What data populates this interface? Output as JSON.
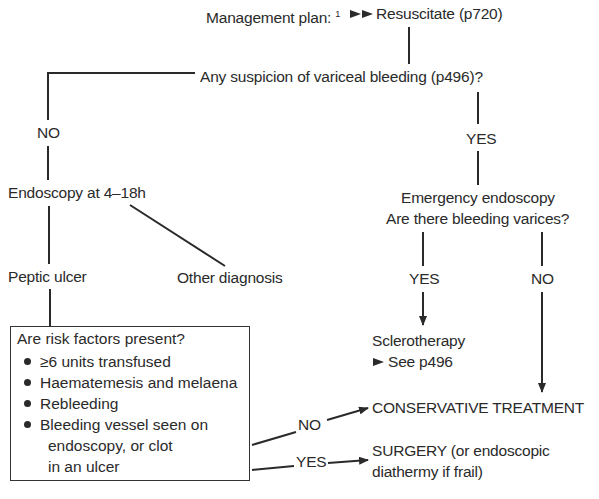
{
  "diagram": {
    "title_label": "Management plan:",
    "title_footnote": "1",
    "title_arrow_icon": "double-right-triangle-icon",
    "resuscitate": "Resuscitate (p720)",
    "variceal_question": "Any suspicion of variceal bleeding (p496)?",
    "left_branch": {
      "no_label": "NO",
      "endoscopy": "Endoscopy at 4–18h",
      "peptic_ulcer": "Peptic ulcer",
      "other_diagnosis": "Other diagnosis",
      "risk_box": {
        "question": "Are risk factors present?",
        "items": [
          {
            "line1": "≥6 units transfused"
          },
          {
            "line1": "Haematemesis and melaena"
          },
          {
            "line1": "Rebleeding"
          },
          {
            "line1": "Bleeding vessel seen on",
            "line2": "endoscopy, or clot",
            "line3": "in an ulcer"
          }
        ]
      },
      "risk_no_label": "NO",
      "risk_yes_label": "YES"
    },
    "right_branch": {
      "yes_label": "YES",
      "emergency_line1": "Emergency endoscopy",
      "emergency_line2": "Are there bleeding varices?",
      "varices_yes_label": "YES",
      "varices_no_label": "NO",
      "sclerotherapy": "Sclerotherapy",
      "see_ref": "See p496"
    },
    "outcomes": {
      "conservative": "CONSERVATIVE TREATMENT",
      "surgery_line1": "SURGERY (or endoscopic",
      "surgery_line2": "diathermy if frail)"
    },
    "colors": {
      "ink": "#2a2a2a",
      "background": "#ffffff"
    }
  }
}
